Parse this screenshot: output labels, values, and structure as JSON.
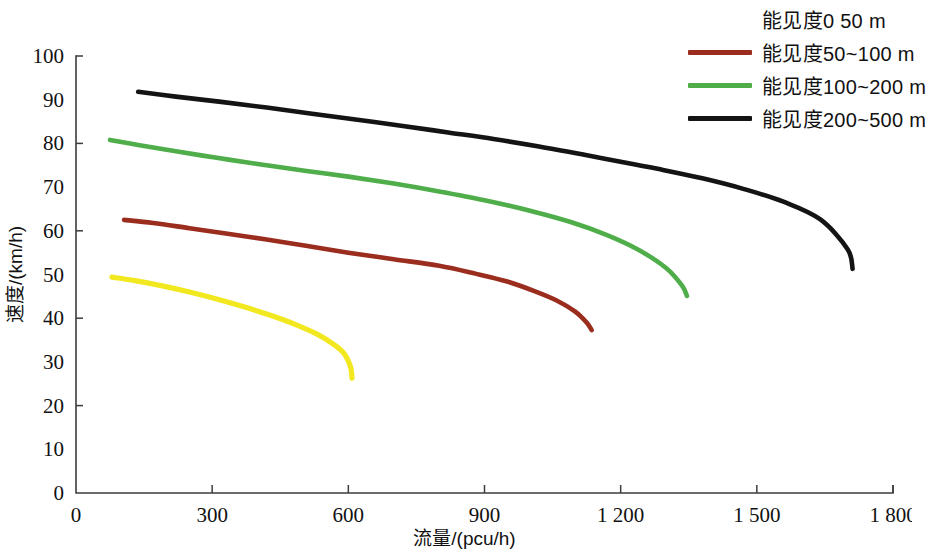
{
  "chart_data": {
    "type": "line",
    "title": "",
    "xlabel": "流量/(pcu/h)",
    "ylabel": "速度/(km/h)",
    "xlim": [
      0,
      1800
    ],
    "ylim": [
      0,
      100
    ],
    "xticks": [
      0,
      300,
      600,
      900,
      1200,
      1500,
      1800
    ],
    "xtick_labels": [
      "0",
      "300",
      "600",
      "900",
      "1 200",
      "1 500",
      "1 800"
    ],
    "yticks": [
      0,
      10,
      20,
      30,
      40,
      50,
      60,
      70,
      80,
      90,
      100
    ],
    "ytick_labels": [
      "0",
      "10",
      "20",
      "30",
      "40",
      "50",
      "60",
      "70",
      "80",
      "90",
      "100"
    ],
    "grid": false,
    "legend_position": "top-right",
    "series": [
      {
        "name": "能见度0~50 m",
        "color": "#f2e81f",
        "legend_swatch_visible": false,
        "x": [
          79,
          130,
          190,
          250,
          310,
          370,
          430,
          480,
          530,
          565,
          590,
          605,
          608
        ],
        "y": [
          49.4,
          48.6,
          47.4,
          46.0,
          44.4,
          42.6,
          40.6,
          38.7,
          36.4,
          34.2,
          32.0,
          28.8,
          26.3
        ]
      },
      {
        "name": "能见度50~100 m",
        "color": "#9b2d1f",
        "legend_swatch_visible": true,
        "x": [
          106,
          170,
          250,
          330,
          420,
          510,
          600,
          700,
          800,
          880,
          950,
          1010,
          1060,
          1100,
          1125,
          1136
        ],
        "y": [
          62.5,
          61.8,
          60.6,
          59.4,
          58.0,
          56.5,
          55.0,
          53.5,
          52.0,
          50.2,
          48.4,
          46.2,
          44.0,
          41.5,
          39.0,
          37.3
        ]
      },
      {
        "name": "能见度100~200 m",
        "color": "#4fae4a",
        "legend_swatch_visible": true,
        "x": [
          75,
          140,
          220,
          310,
          400,
          500,
          600,
          700,
          800,
          900,
          1000,
          1090,
          1170,
          1240,
          1300,
          1335,
          1346
        ],
        "y": [
          80.8,
          79.6,
          78.2,
          76.7,
          75.3,
          73.8,
          72.4,
          70.8,
          69.0,
          67.0,
          64.6,
          62.0,
          59.0,
          55.6,
          51.5,
          47.5,
          45.1
        ]
      },
      {
        "name": "能见度200~500 m",
        "color": "#141414",
        "legend_swatch_visible": true,
        "x": [
          137,
          220,
          320,
          420,
          520,
          620,
          720,
          820,
          920,
          1020,
          1120,
          1200,
          1290,
          1380,
          1470,
          1560,
          1640,
          1700,
          1711
        ],
        "y": [
          91.8,
          90.7,
          89.5,
          88.2,
          86.8,
          85.4,
          84.0,
          82.5,
          81.0,
          79.3,
          77.4,
          75.8,
          74.0,
          72.0,
          69.6,
          66.6,
          62.6,
          55.8,
          51.3
        ]
      }
    ],
    "legend_entries": [
      {
        "label": "能见度0  50 m",
        "color": "#f2e81f",
        "swatch_visible": false
      },
      {
        "label": "能见度50~100 m",
        "color": "#9b2d1f",
        "swatch_visible": true
      },
      {
        "label": "能见度100~200 m",
        "color": "#4fae4a",
        "swatch_visible": true
      },
      {
        "label": "能见度200~500 m",
        "color": "#141414",
        "swatch_visible": true
      }
    ]
  },
  "geometry": {
    "plot_left": 76,
    "plot_right": 893,
    "plot_top": 56,
    "plot_bottom": 493,
    "legend_left": 688,
    "legend_top": 4,
    "legend_row_height": 33
  }
}
